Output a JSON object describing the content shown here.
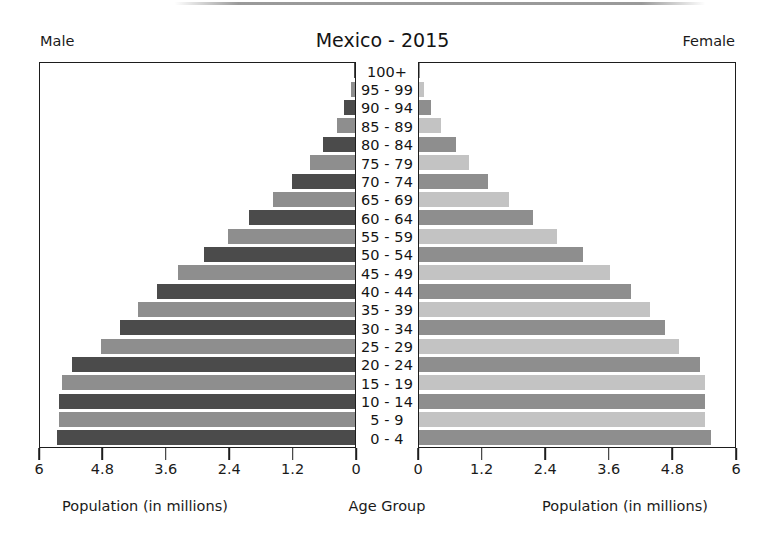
{
  "header": {
    "male_label": "Male",
    "female_label": "Female",
    "title": "Mexico - 2015"
  },
  "captions": {
    "left": "Population (in millions)",
    "center": "Age Group",
    "right": "Population (in millions)"
  },
  "colors": {
    "male_dark": "#4b4b4b",
    "male_light": "#8e8e8e",
    "female_dark": "#8e8e8e",
    "female_light": "#c3c3c3",
    "frame": "#1d1d1d",
    "text": "#1a1a1a",
    "background": "#ffffff"
  },
  "chart_data": {
    "type": "bar",
    "subtype": "population-pyramid",
    "title": "Mexico - 2015",
    "xlabel": "Population (in millions)",
    "ylabel": "Age Group",
    "grid": false,
    "legend": "none",
    "xlim_left": [
      6,
      0
    ],
    "xlim_right": [
      0,
      6
    ],
    "left_ticks": [
      "6",
      "4.8",
      "3.6",
      "2.4",
      "1.2",
      "0"
    ],
    "right_ticks": [
      "0",
      "1.2",
      "2.4",
      "3.6",
      "4.8",
      "6"
    ],
    "tick_values": [
      0,
      1.2,
      2.4,
      3.6,
      4.8,
      6
    ],
    "categories": [
      "0 - 4",
      "5 - 9",
      "10 - 14",
      "15 - 19",
      "20 - 24",
      "25 - 29",
      "30 - 34",
      "35 - 39",
      "40 - 44",
      "45 - 49",
      "50 - 54",
      "55 - 59",
      "60 - 64",
      "65 - 69",
      "70 - 74",
      "75 - 79",
      "80 - 84",
      "85 - 89",
      "90 - 94",
      "95 - 99",
      "100+"
    ],
    "series": [
      {
        "name": "Male",
        "side": "left",
        "values": [
          5.65,
          5.6,
          5.6,
          5.55,
          5.35,
          4.8,
          4.45,
          4.1,
          3.75,
          3.35,
          2.85,
          2.4,
          2.0,
          1.55,
          1.2,
          0.85,
          0.6,
          0.35,
          0.2,
          0.08,
          0.02
        ]
      },
      {
        "name": "Female",
        "side": "right",
        "values": [
          5.5,
          5.4,
          5.4,
          5.4,
          5.3,
          4.9,
          4.65,
          4.35,
          4.0,
          3.6,
          3.1,
          2.6,
          2.15,
          1.7,
          1.3,
          0.95,
          0.7,
          0.42,
          0.22,
          0.09,
          0.02
        ]
      }
    ]
  }
}
